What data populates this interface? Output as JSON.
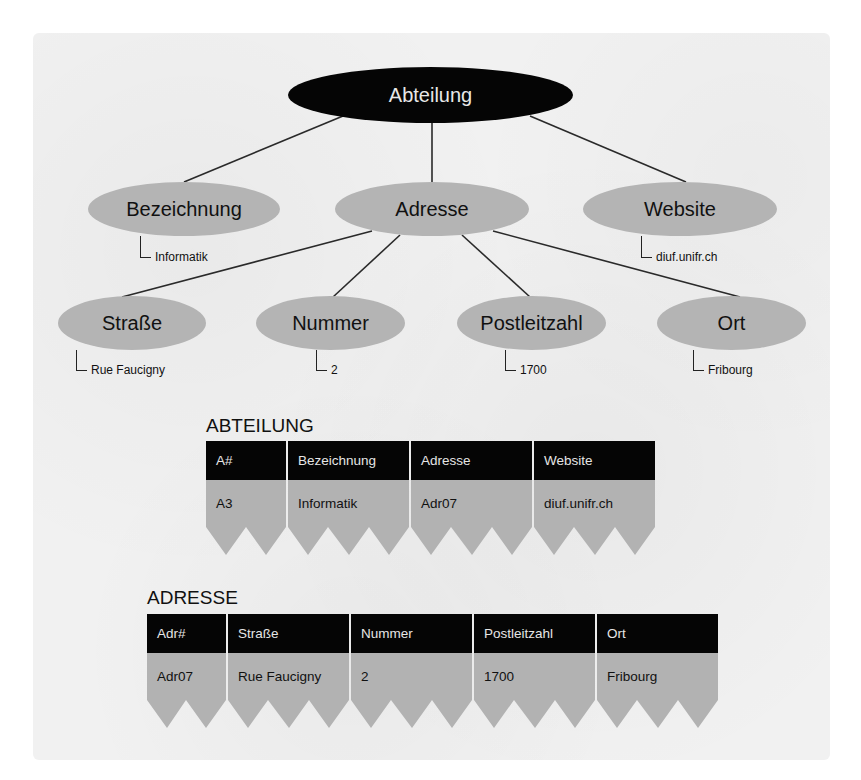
{
  "diagram": {
    "root": {
      "label": "Abteilung"
    },
    "level1": [
      {
        "label": "Bezeichnung",
        "value": "Informatik"
      },
      {
        "label": "Adresse",
        "value": null
      },
      {
        "label": "Website",
        "value": "diuf.unifr.ch"
      }
    ],
    "level2": [
      {
        "label": "Straße",
        "value": "Rue Faucigny"
      },
      {
        "label": "Nummer",
        "value": "2"
      },
      {
        "label": "Postleitzahl",
        "value": "1700"
      },
      {
        "label": "Ort",
        "value": "Fribourg"
      }
    ]
  },
  "tables": [
    {
      "title": "ABTEILUNG",
      "columns": [
        "A#",
        "Bezeichnung",
        "Adresse",
        "Website"
      ],
      "row": [
        "A3",
        "Informatik",
        "Adr07",
        "diuf.unifr.ch"
      ]
    },
    {
      "title": "ADRESSE",
      "columns": [
        "Adr#",
        "Straße",
        "Nummer",
        "Postleitzahl",
        "Ort"
      ],
      "row": [
        "Adr07",
        "Rue Faucigny",
        "2",
        "1700",
        "Fribourg"
      ]
    }
  ],
  "colors": {
    "root_fill": "#050505",
    "attribute_fill": "#b4b4b4",
    "table_header": "#050505",
    "table_body": "#b2b2b2",
    "background": "#f1f1f1"
  }
}
